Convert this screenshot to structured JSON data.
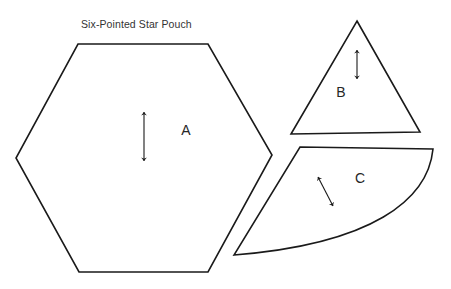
{
  "title": "Six-Pointed Star Pouch",
  "title_position": {
    "x": 81,
    "y": 18
  },
  "colors": {
    "background": "#ffffff",
    "outline": "#1a1a1a",
    "label_text": "#262626",
    "title_text": "#333333"
  },
  "pieces": [
    {
      "id": "A",
      "label": "A",
      "shape": "hexagon",
      "label_position": {
        "x": 186,
        "y": 135
      },
      "outline_points": "78,44 208,44 272,155 208,272 79,272 16,158",
      "grainline": {
        "type": "double-headed-arrow",
        "orientation": "vertical",
        "x1": 144,
        "y1": 112,
        "x2": 144,
        "y2": 161
      }
    },
    {
      "id": "B",
      "label": "B",
      "shape": "triangle",
      "label_position": {
        "x": 341,
        "y": 97
      },
      "outline_points": "357,21 420,132 291,134",
      "grainline": {
        "type": "double-headed-arrow",
        "orientation": "vertical",
        "x1": 357,
        "y1": 50,
        "x2": 357,
        "y2": 79
      }
    },
    {
      "id": "C",
      "label": "C",
      "shape": "curved-wedge",
      "label_position": {
        "x": 360,
        "y": 183
      },
      "outline_path": "M 300,147 L 433,149 C 428,200 372,244 234,255 L 300,147 Z",
      "grainline": {
        "type": "double-headed-arrow",
        "orientation": "diagonal",
        "x1": 333,
        "y1": 206,
        "x2": 318,
        "y2": 177
      }
    }
  ]
}
